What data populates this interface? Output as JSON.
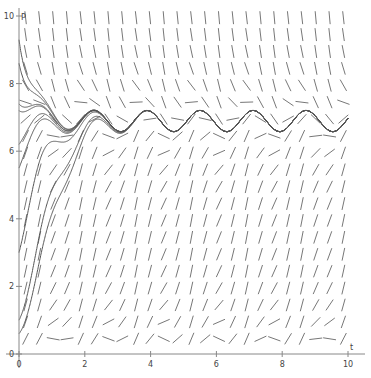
{
  "chart_data": {
    "type": "slope_field",
    "title": "",
    "xlabel": "t",
    "ylabel": "P",
    "xlim": [
      0,
      10
    ],
    "ylim": [
      0,
      10
    ],
    "x_ticks": [
      0,
      2,
      4,
      6,
      8,
      10
    ],
    "y_ticks": [
      0,
      2,
      4,
      6,
      8,
      10
    ],
    "grid": false,
    "equilibrium_approx": 6.9,
    "field_grid": {
      "t_step": 0.42,
      "P_step": 0.5
    },
    "solution_curves_initial_P": [
      0.6,
      1.0,
      3.0,
      5.5,
      6.2,
      7.2,
      7.4,
      8.6,
      9.3
    ]
  },
  "axes": {
    "x_label": "t",
    "y_label": "P",
    "x_tick_labels": [
      "0",
      "2",
      "4",
      "6",
      "8",
      "10"
    ],
    "y_tick_labels": [
      "0",
      "2",
      "4",
      "6",
      "8",
      "10"
    ]
  },
  "colors": {
    "segment": "#777777",
    "curve": "#555555",
    "axis": "#888888"
  }
}
